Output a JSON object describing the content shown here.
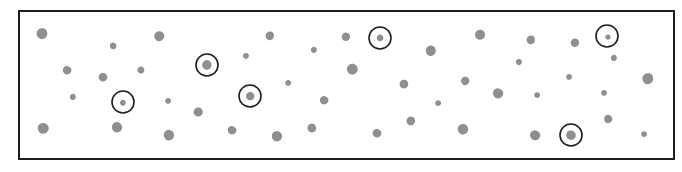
{
  "figure": {
    "width": 682,
    "height": 172,
    "frame": {
      "x": 18,
      "y": 10,
      "width": 655,
      "height": 148,
      "stroke": "#1e1e1e"
    },
    "colors": {
      "dot_fill": "#8f8f8f",
      "circle_stroke": "#1e1e1e",
      "background": "#ffffff"
    },
    "dots": [
      {
        "x": 42,
        "y": 34,
        "d": 13
      },
      {
        "x": 113,
        "y": 46,
        "d": 8
      },
      {
        "x": 159,
        "y": 36,
        "d": 12
      },
      {
        "x": 67,
        "y": 70,
        "d": 10
      },
      {
        "x": 103,
        "y": 77,
        "d": 10
      },
      {
        "x": 141,
        "y": 70,
        "d": 8
      },
      {
        "x": 73,
        "y": 97,
        "d": 7
      },
      {
        "x": 123,
        "y": 103,
        "d": 7
      },
      {
        "x": 168,
        "y": 101,
        "d": 7
      },
      {
        "x": 198,
        "y": 112,
        "d": 11
      },
      {
        "x": 43,
        "y": 128,
        "d": 13
      },
      {
        "x": 117,
        "y": 127,
        "d": 12
      },
      {
        "x": 169,
        "y": 135,
        "d": 12
      },
      {
        "x": 207,
        "y": 65,
        "d": 11
      },
      {
        "x": 270,
        "y": 36,
        "d": 10
      },
      {
        "x": 246,
        "y": 56,
        "d": 7
      },
      {
        "x": 288,
        "y": 83,
        "d": 7
      },
      {
        "x": 250,
        "y": 96,
        "d": 10
      },
      {
        "x": 232,
        "y": 130,
        "d": 10
      },
      {
        "x": 277,
        "y": 136,
        "d": 12
      },
      {
        "x": 312,
        "y": 128,
        "d": 10
      },
      {
        "x": 314,
        "y": 50,
        "d": 7
      },
      {
        "x": 346,
        "y": 37,
        "d": 10
      },
      {
        "x": 380,
        "y": 38,
        "d": 8
      },
      {
        "x": 352,
        "y": 69,
        "d": 13
      },
      {
        "x": 324,
        "y": 100,
        "d": 10
      },
      {
        "x": 377,
        "y": 133,
        "d": 10
      },
      {
        "x": 404,
        "y": 84,
        "d": 10
      },
      {
        "x": 411,
        "y": 121,
        "d": 10
      },
      {
        "x": 431,
        "y": 51,
        "d": 12
      },
      {
        "x": 480,
        "y": 35,
        "d": 12
      },
      {
        "x": 465,
        "y": 81,
        "d": 10
      },
      {
        "x": 438,
        "y": 103,
        "d": 7
      },
      {
        "x": 498,
        "y": 93,
        "d": 12
      },
      {
        "x": 463,
        "y": 129,
        "d": 12
      },
      {
        "x": 519,
        "y": 62,
        "d": 7
      },
      {
        "x": 531,
        "y": 40,
        "d": 10
      },
      {
        "x": 575,
        "y": 43,
        "d": 10
      },
      {
        "x": 569,
        "y": 77,
        "d": 7
      },
      {
        "x": 537,
        "y": 95,
        "d": 7
      },
      {
        "x": 535,
        "y": 135,
        "d": 12
      },
      {
        "x": 571,
        "y": 135,
        "d": 11
      },
      {
        "x": 608,
        "y": 37,
        "d": 6
      },
      {
        "x": 614,
        "y": 58,
        "d": 7
      },
      {
        "x": 648,
        "y": 79,
        "d": 13
      },
      {
        "x": 604,
        "y": 93,
        "d": 7
      },
      {
        "x": 608,
        "y": 119,
        "d": 10
      },
      {
        "x": 644,
        "y": 134,
        "d": 7
      }
    ],
    "circles": [
      {
        "x": 207,
        "y": 65,
        "r": 11
      },
      {
        "x": 123,
        "y": 102,
        "r": 11
      },
      {
        "x": 250,
        "y": 96,
        "r": 11
      },
      {
        "x": 380,
        "y": 38,
        "r": 11
      },
      {
        "x": 607,
        "y": 36,
        "r": 11
      },
      {
        "x": 571,
        "y": 135,
        "r": 11
      }
    ],
    "summary": {
      "total_dots": 48,
      "circled_dots": 6
    }
  }
}
